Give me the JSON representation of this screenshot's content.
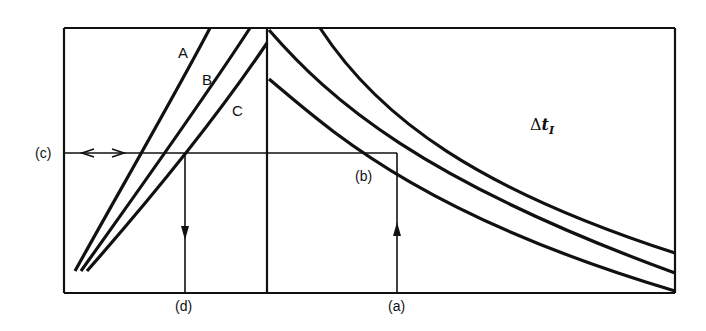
{
  "diagram": {
    "type": "nomograph",
    "curve_labels": [
      "A",
      "B",
      "C"
    ],
    "axis_markers": {
      "left": "(c)",
      "bottom_left": "(d)",
      "bottom_right": "(a)",
      "intersection": "(b)"
    },
    "quantity_label": {
      "symbol": "Δ",
      "variable": "t",
      "subscript": "I"
    },
    "colors": {
      "line": "#111111",
      "background": "#ffffff"
    }
  }
}
